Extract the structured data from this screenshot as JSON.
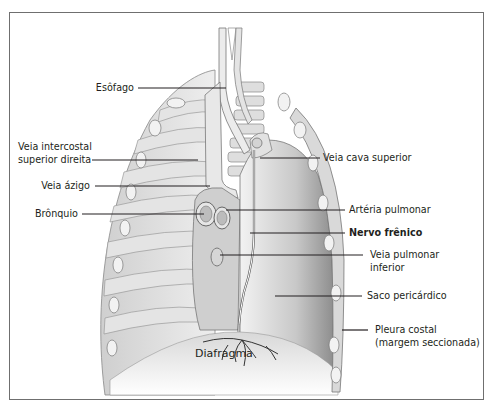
{
  "diagram": {
    "type": "anatomical-illustration",
    "labels_left": [
      {
        "id": "esofago",
        "text": "Esôfago"
      },
      {
        "id": "veia-intercostal",
        "line1": "Veia intercostal",
        "line2": "superior direita"
      },
      {
        "id": "veia-azigo",
        "text": "Veia ázigo"
      },
      {
        "id": "bronquio",
        "text": "Brônquio"
      }
    ],
    "labels_right": [
      {
        "id": "veia-cava-superior",
        "text": "Veia cava superior"
      },
      {
        "id": "arteria-pulmonar",
        "text": "Artéria pulmonar"
      },
      {
        "id": "nervo-frenico",
        "text": "Nervo frênico",
        "emphasis": "bold"
      },
      {
        "id": "veia-pulmonar-inferior",
        "line1": "Veia pulmonar",
        "line2": "inferior"
      },
      {
        "id": "saco-pericardico",
        "text": "Saco pericárdico"
      },
      {
        "id": "pleura-costal",
        "line1": "Pleura costal",
        "line2": "(margem seccionada)"
      }
    ],
    "labels_bottom": [
      {
        "id": "diafragma",
        "text": "Diafragma"
      }
    ],
    "colors": {
      "line": "#231f20",
      "border": "#6f6f6f",
      "tissue_light": "#e6e6e6",
      "tissue_mid": "#bdbdbd",
      "tissue_dark": "#8c8c8c"
    }
  }
}
